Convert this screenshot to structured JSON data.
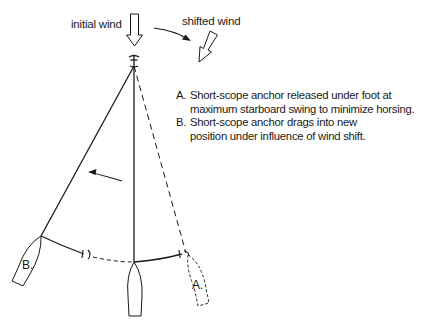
{
  "diagram": {
    "labels": {
      "initial_wind": "initial wind",
      "shifted_wind": "shifted wind"
    },
    "legend": [
      {
        "key": "A.",
        "text": "Short-scope anchor released under foot at\nmaximum starboard swing to minimize horsing."
      },
      {
        "key": "B.",
        "text": "Short-scope anchor drags into new\nposition under influence of wind shift."
      }
    ],
    "boat_labels": {
      "a": "A.",
      "b": "B."
    },
    "colors": {
      "line": "#1a1a1a",
      "background": "#ffffff"
    }
  }
}
